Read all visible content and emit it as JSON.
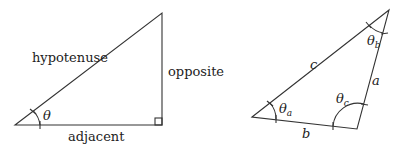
{
  "right_triangle": {
    "hypotenuse_label": "hypotenuse",
    "opposite_label": "opposite",
    "adjacent_label": "adjacent",
    "angle_label": "θ"
  },
  "general_triangle": {
    "side_a": "a",
    "side_b": "b",
    "side_c": "c",
    "angle_a": "θ",
    "angle_a_sub": "a",
    "angle_b": "θ",
    "angle_b_sub": "b",
    "angle_c": "θ",
    "angle_c_sub": "c"
  }
}
